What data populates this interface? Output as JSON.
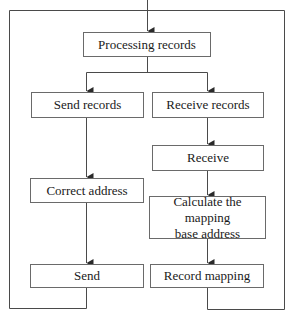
{
  "diagram": {
    "type": "flowchart",
    "nodes": {
      "processing": {
        "label": "Processing records"
      },
      "send_records": {
        "label": "Send records"
      },
      "receive_records": {
        "label": "Receive records"
      },
      "receive": {
        "label": "Receive"
      },
      "correct_address": {
        "label": "Correct address"
      },
      "calculate": {
        "label": "Calculate the mapping\nbase address"
      },
      "send": {
        "label": "Send"
      },
      "record_mapping": {
        "label": "Record mapping"
      }
    },
    "edges": [
      {
        "from": "entry",
        "to": "processing"
      },
      {
        "from": "processing",
        "to": "send_records"
      },
      {
        "from": "processing",
        "to": "receive_records"
      },
      {
        "from": "send_records",
        "to": "correct_address"
      },
      {
        "from": "correct_address",
        "to": "send"
      },
      {
        "from": "receive_records",
        "to": "receive"
      },
      {
        "from": "receive",
        "to": "calculate"
      },
      {
        "from": "calculate",
        "to": "record_mapping"
      },
      {
        "from": "send",
        "to": "loop-back"
      },
      {
        "from": "record_mapping",
        "to": "loop-back"
      }
    ],
    "colors": {
      "line": "#3a3a3a",
      "box_border": "#6a6a6a",
      "text": "#1a1a1a",
      "background": "#ffffff"
    }
  }
}
